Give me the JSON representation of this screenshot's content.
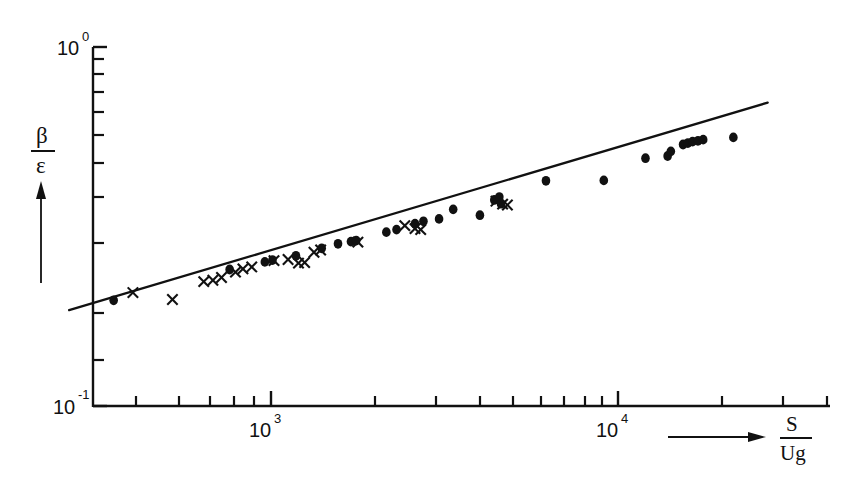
{
  "figure": {
    "title": "",
    "background_color": "#ffffff",
    "ink_color": "#111111"
  },
  "axes": {
    "y": {
      "label_numerator": "β",
      "label_denominator": "ε",
      "label_plain": "β/ε",
      "scale": "log",
      "min": 0.1,
      "max": 1.0,
      "tick_labels": [
        "10",
        "10"
      ],
      "tick_exponents": [
        "-1",
        "0"
      ],
      "tick_values": [
        0.1,
        1.0
      ],
      "minor_tick_values": [
        0.15,
        0.2,
        0.3,
        0.4,
        0.5,
        0.6,
        0.7,
        0.8,
        0.9
      ],
      "arrow": "up"
    },
    "x": {
      "label_numerator": "S",
      "label_denominator": "Ug",
      "label_plain": "S/Ug",
      "scale": "log",
      "min": 230,
      "max": 30000,
      "tick_labels": [
        "10",
        "10"
      ],
      "tick_exponents": [
        "3",
        "4"
      ],
      "tick_values": [
        1000,
        10000
      ],
      "minor_tick_values": [
        300,
        400,
        500,
        600,
        700,
        800,
        900,
        2000,
        3000,
        4000,
        5000,
        6000,
        7000,
        8000,
        9000,
        20000,
        30000
      ],
      "arrow": "right"
    }
  },
  "chart_data": {
    "type": "scatter",
    "title": "",
    "xlabel": "S/Ug",
    "ylabel": "β/ε",
    "xscale": "log",
    "yscale": "log",
    "xlim": [
      230,
      30000
    ],
    "ylim": [
      0.1,
      1.0
    ],
    "grid": false,
    "legend": "none",
    "series": [
      {
        "name": "filled-circle-data",
        "marker": "filled-circle",
        "points": [
          [
            352,
            0.197
          ],
          [
            760,
            0.24
          ],
          [
            960,
            0.252
          ],
          [
            1010,
            0.255
          ],
          [
            1180,
            0.262
          ],
          [
            1400,
            0.275
          ],
          [
            1560,
            0.283
          ],
          [
            1700,
            0.287
          ],
          [
            1760,
            0.289
          ],
          [
            2150,
            0.305
          ],
          [
            2300,
            0.31
          ],
          [
            2600,
            0.322
          ],
          [
            2750,
            0.327
          ],
          [
            3050,
            0.332
          ],
          [
            3350,
            0.353
          ],
          [
            4000,
            0.34
          ],
          [
            4400,
            0.375
          ],
          [
            4550,
            0.382
          ],
          [
            4600,
            0.366
          ],
          [
            6200,
            0.424
          ],
          [
            9100,
            0.425
          ],
          [
            12000,
            0.49
          ],
          [
            13900,
            0.497
          ],
          [
            14200,
            0.512
          ],
          [
            15400,
            0.535
          ],
          [
            15900,
            0.54
          ],
          [
            16400,
            0.545
          ],
          [
            17000,
            0.548
          ],
          [
            17600,
            0.552
          ],
          [
            21500,
            0.56
          ]
        ]
      },
      {
        "name": "cross-data",
        "marker": "cross",
        "points": [
          [
            400,
            0.207
          ],
          [
            520,
            0.198
          ],
          [
            640,
            0.222
          ],
          [
            680,
            0.224
          ],
          [
            720,
            0.228
          ],
          [
            790,
            0.236
          ],
          [
            830,
            0.241
          ],
          [
            880,
            0.244
          ],
          [
            1020,
            0.254
          ],
          [
            1120,
            0.256
          ],
          [
            1200,
            0.25
          ],
          [
            1250,
            0.251
          ],
          [
            1330,
            0.268
          ],
          [
            1390,
            0.272
          ],
          [
            1780,
            0.286
          ],
          [
            2430,
            0.318
          ],
          [
            2600,
            0.312
          ],
          [
            2700,
            0.31
          ],
          [
            4450,
            0.372
          ],
          [
            4650,
            0.365
          ],
          [
            4800,
            0.363
          ]
        ]
      }
    ],
    "fit_line": {
      "name": "power-law-fit",
      "style": "solid",
      "x_start": 262,
      "y_start": 0.185,
      "x_end": 27000,
      "y_end": 0.7,
      "slope_loglog": 0.287
    }
  }
}
